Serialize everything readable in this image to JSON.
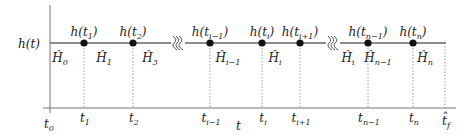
{
  "y_axis_label": {
    "base": "h(t)"
  },
  "x_axis_label": {
    "base": "t"
  },
  "origin_label": {
    "base": "t",
    "sub": "0"
  },
  "points": [
    {
      "x": 84,
      "top": {
        "pre": "h(t",
        "sub": "1",
        "post": ")"
      },
      "tick": {
        "base": "t",
        "sub": "1"
      }
    },
    {
      "x": 133,
      "top": {
        "pre": "h(t",
        "sub": "2",
        "post": ")"
      },
      "tick": {
        "base": "t",
        "sub": "2"
      }
    },
    {
      "x": 210,
      "top": {
        "pre": "h(t",
        "sub": "i−1",
        "post": ")"
      },
      "tick": {
        "base": "t",
        "sub": "i−1"
      }
    },
    {
      "x": 262,
      "top": {
        "pre": "h(t",
        "sub": "i",
        "post": ")"
      },
      "tick": {
        "base": "t",
        "sub": "i"
      }
    },
    {
      "x": 300,
      "top": {
        "pre": "h(t",
        "sub": "i+1",
        "post": ")"
      },
      "tick": {
        "base": "t",
        "sub": "i+1"
      }
    },
    {
      "x": 368,
      "top": {
        "pre": "h(t",
        "sub": "n−1",
        "post": ")"
      },
      "tick": {
        "base": "t",
        "sub": "n−1"
      }
    },
    {
      "x": 413,
      "top": {
        "pre": "h(t",
        "sub": "n",
        "post": ")"
      },
      "tick": {
        "base": "t",
        "sub": "n"
      }
    }
  ],
  "final_tick": {
    "x": 445,
    "base": "t̂",
    "sub": "f"
  },
  "interval_labels": [
    {
      "x": 60,
      "base": "Ĥ",
      "sub": "0"
    },
    {
      "x": 104,
      "base": "Ĥ",
      "sub": "1"
    },
    {
      "x": 150,
      "base": "Ĥ",
      "sub": "3"
    },
    {
      "x": 228,
      "base": "Ĥ",
      "sub": "i−1"
    },
    {
      "x": 275,
      "base": "Ĥ",
      "sub": "i"
    },
    {
      "x": 348,
      "base": "Ĥ",
      "sub": "i"
    },
    {
      "x": 378,
      "base": "Ĥ",
      "sub": "n−1"
    },
    {
      "x": 425,
      "base": "Ĥ",
      "sub": "n"
    }
  ],
  "breaks": [
    {
      "x": 178
    },
    {
      "x": 333
    }
  ]
}
